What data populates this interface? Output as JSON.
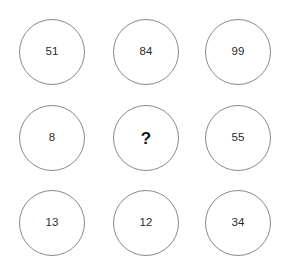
{
  "puzzle": {
    "type": "number-grid",
    "rows": 3,
    "columns": 3,
    "background_color": "#ffffff",
    "circle_border_color": "#8a8a8a",
    "value_color": "#2b2b2b",
    "unknown_color": "#141414",
    "unknown_marker": "?",
    "cells": [
      {
        "id": "cell-r0c0",
        "row": 0,
        "col": 0,
        "value": "51",
        "unknown": false
      },
      {
        "id": "cell-r0c1",
        "row": 0,
        "col": 1,
        "value": "84",
        "unknown": false
      },
      {
        "id": "cell-r0c2",
        "row": 0,
        "col": 2,
        "value": "99",
        "unknown": false
      },
      {
        "id": "cell-r1c0",
        "row": 1,
        "col": 0,
        "value": "8",
        "unknown": false
      },
      {
        "id": "cell-r1c1",
        "row": 1,
        "col": 1,
        "value": "?",
        "unknown": true
      },
      {
        "id": "cell-r1c2",
        "row": 1,
        "col": 2,
        "value": "55",
        "unknown": false
      },
      {
        "id": "cell-r2c0",
        "row": 2,
        "col": 0,
        "value": "13",
        "unknown": false
      },
      {
        "id": "cell-r2c1",
        "row": 2,
        "col": 1,
        "value": "12",
        "unknown": false
      },
      {
        "id": "cell-r2c2",
        "row": 2,
        "col": 2,
        "value": "34",
        "unknown": false
      }
    ]
  }
}
